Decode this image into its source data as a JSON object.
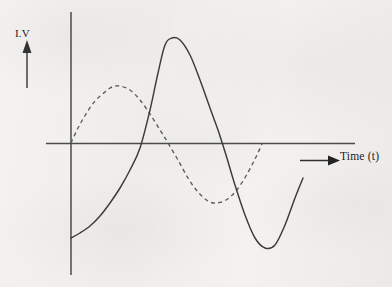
{
  "figure": {
    "y_axis_label": "I.V",
    "x_axis_label": "Time (t)",
    "background_color": "#f1f0ee",
    "line_color": "#3c3c3c",
    "axis_color": "#474747"
  },
  "chart_data": {
    "type": "line",
    "title": "",
    "xlabel": "Time (t)",
    "ylabel": "I.V",
    "grid": false,
    "legend": "none",
    "xlim": [
      0,
      1
    ],
    "ylim": [
      -1.15,
      1.15
    ],
    "axes": {
      "origin_px": [
        71,
        143
      ],
      "y_axis_top_px": 12,
      "y_axis_bottom_px": 275,
      "x_axis_left_px": 46,
      "x_axis_right_px": 355,
      "x_axis_arrow_start_px": 300,
      "x_axis_arrow_end_px": 338,
      "y_axis_arrow_top_px": 42,
      "y_axis_arrow_bottom_px": 88
    },
    "series": [
      {
        "name": "solid-wave",
        "style": "solid",
        "color": "#3c3c3c",
        "description": "Sine wave starting below axis at origin, rising through zero, peaking, falling through zero to a trough, then rising again at the right edge",
        "points_px": [
          [
            71,
            238
          ],
          [
            80,
            233
          ],
          [
            90,
            226
          ],
          [
            100,
            216
          ],
          [
            110,
            203
          ],
          [
            120,
            188
          ],
          [
            130,
            170
          ],
          [
            140,
            148
          ],
          [
            150,
            110
          ],
          [
            158,
            73
          ],
          [
            165,
            45
          ],
          [
            172,
            38
          ],
          [
            180,
            40
          ],
          [
            190,
            55
          ],
          [
            200,
            80
          ],
          [
            210,
            108
          ],
          [
            218,
            130
          ],
          [
            226,
            155
          ],
          [
            235,
            185
          ],
          [
            245,
            215
          ],
          [
            255,
            238
          ],
          [
            265,
            248
          ],
          [
            275,
            245
          ],
          [
            285,
            225
          ],
          [
            295,
            198
          ],
          [
            303,
            178
          ]
        ]
      },
      {
        "name": "dashed-wave",
        "style": "dashed",
        "color": "#5a5a5a",
        "description": "Phase-shifted sine wave of smaller amplitude starting at the origin, peaking early, crossing zero, reaching a trough, then returning to the axis",
        "points_px": [
          [
            71,
            143
          ],
          [
            78,
            128
          ],
          [
            86,
            114
          ],
          [
            95,
            101
          ],
          [
            105,
            92
          ],
          [
            112,
            87
          ],
          [
            120,
            86
          ],
          [
            130,
            90
          ],
          [
            140,
            100
          ],
          [
            150,
            114
          ],
          [
            160,
            130
          ],
          [
            168,
            143
          ],
          [
            178,
            160
          ],
          [
            188,
            178
          ],
          [
            198,
            192
          ],
          [
            208,
            201
          ],
          [
            216,
            203
          ],
          [
            226,
            200
          ],
          [
            236,
            191
          ],
          [
            246,
            176
          ],
          [
            255,
            159
          ],
          [
            262,
            144
          ]
        ]
      }
    ]
  }
}
